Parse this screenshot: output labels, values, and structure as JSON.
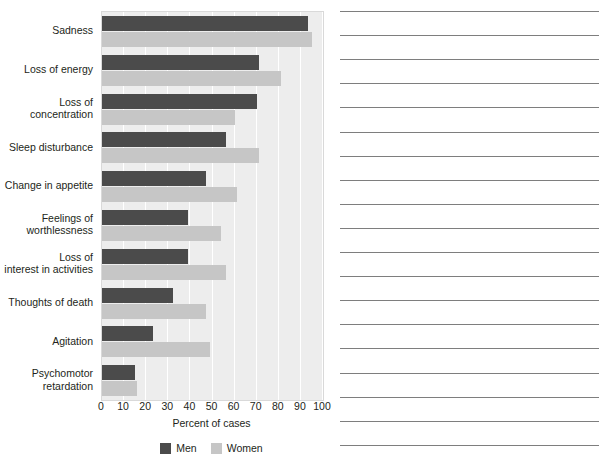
{
  "chart_data": {
    "type": "bar",
    "orientation": "horizontal",
    "title": "",
    "xlabel": "Percent of cases",
    "ylabel": "",
    "xlim": [
      0,
      100
    ],
    "xticks": [
      0,
      10,
      20,
      30,
      40,
      50,
      60,
      70,
      80,
      90,
      100
    ],
    "grid": true,
    "legend_position": "bottom-center",
    "categories": [
      "Sadness",
      "Loss of energy",
      "Loss of\nconcentration",
      "Sleep disturbance",
      "Change in appetite",
      "Feelings of\nworthlessness",
      "Loss of\ninterest in activities",
      "Thoughts of death",
      "Agitation",
      "Psychomotor\nretardation"
    ],
    "series": [
      {
        "name": "Men",
        "color": "#4b4b4b",
        "values": [
          93,
          71,
          70,
          56,
          47,
          39,
          39,
          32,
          23,
          15
        ]
      },
      {
        "name": "Women",
        "color": "#c6c6c6",
        "values": [
          95,
          81,
          60,
          71,
          61,
          54,
          56,
          47,
          49,
          16
        ]
      }
    ]
  },
  "figure": {
    "axis_title": "Percent of cases",
    "tick_labels": [
      "0",
      "10",
      "20",
      "30",
      "40",
      "50",
      "60",
      "70",
      "80",
      "90",
      "100"
    ],
    "category_labels": [
      "Sadness",
      "Loss of energy",
      "Loss of<br>concentration",
      "Sleep disturbance",
      "Change in appetite",
      "Feelings of<br>worthlessness",
      "Loss of<br>interest in activities",
      "Thoughts of death",
      "Agitation",
      "Psychomotor<br>retardation"
    ],
    "legend": [
      {
        "label": "Men",
        "color": "#4b4b4b"
      },
      {
        "label": "Women",
        "color": "#c6c6c6"
      }
    ]
  },
  "notes": {
    "line_count": 19
  }
}
